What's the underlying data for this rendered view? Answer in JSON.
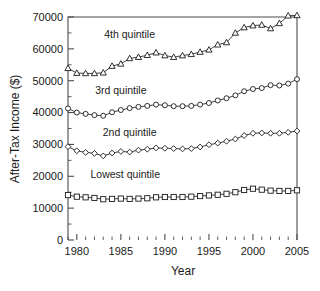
{
  "chart_data": {
    "type": "line",
    "title": "",
    "xlabel": "Year",
    "ylabel": "After-Tax Income ($)",
    "xlim": [
      1979,
      2005
    ],
    "ylim": [
      0,
      70000
    ],
    "grid": false,
    "legend_position": "inline-annotations",
    "x_tick_labels": [
      "1980",
      "1985",
      "1990",
      "1995",
      "2000",
      "2005"
    ],
    "x_tick_values": [
      1980,
      1985,
      1990,
      1995,
      2000,
      2005
    ],
    "y_tick_labels": [
      "0",
      "10000",
      "20000",
      "30000",
      "40000",
      "50000",
      "60000",
      "70000"
    ],
    "y_tick_values": [
      0,
      10000,
      20000,
      30000,
      40000,
      50000,
      60000,
      70000
    ],
    "x": [
      1979,
      1980,
      1981,
      1982,
      1983,
      1984,
      1985,
      1986,
      1987,
      1988,
      1989,
      1990,
      1991,
      1992,
      1993,
      1994,
      1995,
      1996,
      1997,
      1998,
      1999,
      2000,
      2001,
      2002,
      2003,
      2004,
      2005
    ],
    "series": [
      {
        "name": "4th quintile",
        "marker": "triangle",
        "label_x": 1986.0,
        "label_y": 63500,
        "values": [
          53900,
          52400,
          52300,
          52300,
          52500,
          54600,
          55300,
          57000,
          57400,
          58000,
          58800,
          57900,
          57400,
          57900,
          58300,
          59000,
          59700,
          61300,
          62000,
          65000,
          66700,
          67300,
          67500,
          66400,
          68000,
          70400,
          70500
        ]
      },
      {
        "name": "3rd quintile",
        "marker": "circle",
        "label_x": 1985.0,
        "label_y": 45800,
        "values": [
          41300,
          40000,
          39600,
          39200,
          39000,
          40100,
          40800,
          41400,
          41800,
          42100,
          42500,
          42300,
          42000,
          42000,
          42100,
          42500,
          43000,
          43800,
          44500,
          45400,
          46700,
          47400,
          47700,
          48600,
          48500,
          49100,
          50500
        ]
      },
      {
        "name": "2nd quintile",
        "marker": "diamond",
        "label_x": 1986.0,
        "label_y": 32700,
        "values": [
          29300,
          28000,
          27500,
          27200,
          26400,
          27300,
          27800,
          27600,
          28200,
          28500,
          28900,
          28800,
          28700,
          28600,
          28700,
          29200,
          29900,
          30400,
          31000,
          31700,
          32800,
          33500,
          33600,
          33500,
          33500,
          33800,
          34200
        ]
      },
      {
        "name": "Lowest quintile",
        "marker": "square",
        "label_x": 1985.5,
        "label_y": 19400,
        "values": [
          14100,
          13600,
          13400,
          13200,
          12800,
          12900,
          13000,
          12900,
          13000,
          13100,
          13400,
          13500,
          13500,
          13500,
          13600,
          13800,
          14000,
          14200,
          14500,
          15000,
          15700,
          16100,
          15800,
          15500,
          15400,
          15400,
          15600
        ]
      }
    ]
  }
}
